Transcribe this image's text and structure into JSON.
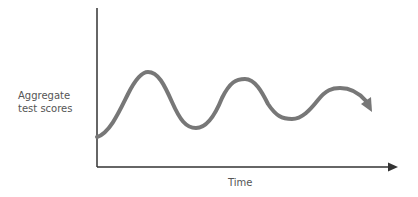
{
  "diagram": {
    "y_axis_label_line1": "Aggregate",
    "y_axis_label_line2": "test scores",
    "x_axis_label": "Time",
    "colors": {
      "axis": "#333333",
      "curve": "#777777",
      "text": "#555555"
    }
  }
}
